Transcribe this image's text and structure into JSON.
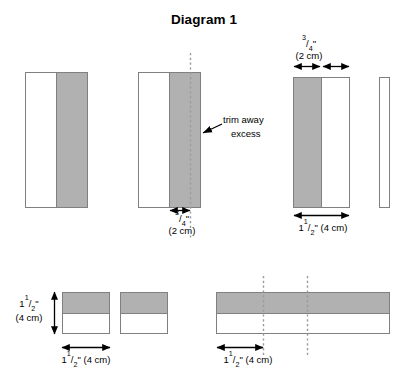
{
  "title": "Diagram 1",
  "colors": {
    "gray_fill": "#b1b1b1",
    "white_fill": "#ffffff",
    "outline": "#808080",
    "dotted_line": "#9a9a9a",
    "text": "#000000"
  },
  "annotations": {
    "trim_away_line1": "trim away",
    "trim_away_line2": "excess"
  },
  "dimensions": {
    "three_quarter_inch_num": "3",
    "three_quarter_inch_den": "4",
    "three_quarter_inch_unit": "\"",
    "two_cm": "(2 cm)",
    "one_and_half_whole": "1",
    "one_and_half_num": "1",
    "one_and_half_den": "2",
    "one_and_half_unit": "\"",
    "four_cm": "(4 cm)",
    "one_and_half_with_cm_suffix": " (4 cm)"
  },
  "figures": [
    {
      "name": "figure-1-panel",
      "description": "Tall rectangle, white left strip and gray right strip",
      "parts": [
        {
          "fill": "white",
          "x": 25,
          "y": 72,
          "w": 32,
          "h": 136
        },
        {
          "fill": "gray",
          "x": 57,
          "y": 72,
          "w": 31,
          "h": 136
        }
      ]
    },
    {
      "name": "figure-2-panel-with-trim-line",
      "description": "Tall rectangle with dotted trim line near right edge",
      "parts": [
        {
          "fill": "white",
          "x": 138,
          "y": 72,
          "w": 32,
          "h": 136
        },
        {
          "fill": "gray",
          "x": 170,
          "y": 72,
          "w": 31,
          "h": 136
        }
      ],
      "cut_lines_x": [
        190
      ],
      "labels": {
        "below": {
          "fraction": "3/4\"",
          "metric": "(2 cm)"
        }
      }
    },
    {
      "name": "figure-3-panel-trimmed",
      "description": "Tall rectangle, gray left strip and white right strip",
      "parts": [
        {
          "fill": "gray",
          "x": 293,
          "y": 77,
          "w": 28,
          "h": 131
        },
        {
          "fill": "white",
          "x": 321,
          "y": 77,
          "w": 29,
          "h": 131
        }
      ],
      "labels": {
        "above": {
          "fraction": "3/4\"",
          "metric": "(2 cm)"
        },
        "below": {
          "fraction": "1 1/2\"",
          "metric": "(4 cm)"
        }
      }
    },
    {
      "name": "figure-4-narrow-strip",
      "description": "Separate narrow white strip (the trimmed-off excess piece)",
      "parts": [
        {
          "fill": "white",
          "x": 379,
          "y": 77,
          "w": 11,
          "h": 131
        }
      ]
    },
    {
      "name": "figure-5-square-left",
      "description": "Square with gray upper half and white lower half",
      "parts": [
        {
          "fill": "gray",
          "x": 62,
          "y": 292,
          "w": 48,
          "h": 21
        },
        {
          "fill": "white",
          "x": 62,
          "y": 313,
          "w": 48,
          "h": 20
        }
      ],
      "labels": {
        "left": {
          "fraction": "1 1/2\"",
          "metric": "(4 cm)"
        },
        "below": {
          "fraction": "1 1/2\"",
          "metric": "(4 cm)"
        }
      }
    },
    {
      "name": "figure-6-square-right",
      "description": "Square with gray upper half and white lower half",
      "parts": [
        {
          "fill": "gray",
          "x": 120,
          "y": 292,
          "w": 48,
          "h": 21
        },
        {
          "fill": "white",
          "x": 120,
          "y": 313,
          "w": 48,
          "h": 20
        }
      ]
    },
    {
      "name": "figure-7-long-bar",
      "description": "Long bar with gray upper half and white lower half, two dotted cut lines",
      "parts": [
        {
          "fill": "gray",
          "x": 216,
          "y": 292,
          "w": 174,
          "h": 21
        },
        {
          "fill": "white",
          "x": 216,
          "y": 313,
          "w": 174,
          "h": 20
        }
      ],
      "cut_lines_x": [
        263,
        307
      ],
      "labels": {
        "below": {
          "fraction": "1 1/2\"",
          "metric": "(4 cm)"
        }
      }
    }
  ]
}
